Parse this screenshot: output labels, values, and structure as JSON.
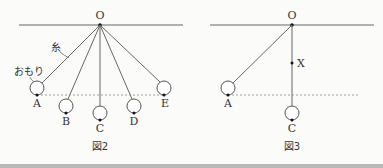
{
  "figure2": {
    "caption": "図2",
    "pivot_label": "O",
    "string_label": "糸",
    "weight_label": "おもり",
    "positions": [
      {
        "label": "A",
        "cx": 37,
        "cy": 88
      },
      {
        "label": "B",
        "cx": 66,
        "cy": 106
      },
      {
        "label": "C",
        "cx": 100,
        "cy": 113
      },
      {
        "label": "D",
        "cx": 134,
        "cy": 106
      },
      {
        "label": "E",
        "cx": 164,
        "cy": 88
      }
    ]
  },
  "figure3": {
    "caption": "図3",
    "pivot_label": "O",
    "nail_label": "X",
    "positions": [
      {
        "label": "A",
        "cx": 228,
        "cy": 88
      },
      {
        "label": "C",
        "cx": 291,
        "cy": 113
      }
    ]
  },
  "colors": {
    "line": "#555555",
    "dot": "#111111",
    "dotted": "#888888"
  }
}
